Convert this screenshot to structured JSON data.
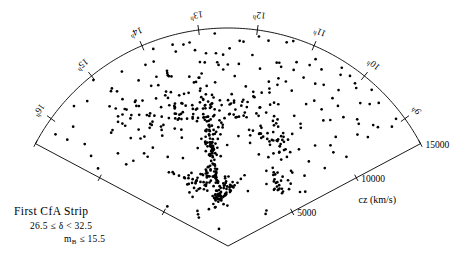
{
  "figure": {
    "title": "First CfA Strip",
    "dec_range": "26.5  ≤  δ <  32.5",
    "mag_limit_prefix": "m",
    "mag_limit_sub": "B",
    "mag_limit_suffix": "≤      15.5",
    "radial_axis_label": "cz  (km/s)"
  },
  "chart_data": {
    "type": "scatter",
    "subtype": "polar-wedge-redshift-survey",
    "title": "First CfA Strip",
    "subtitle": "26.5 ≤ δ < 32.5 ; m_B ≤ 15.5",
    "xlabel": "Right Ascension (hours)",
    "ylabel": "cz (km/s)",
    "radial_label": "cz  (km/s)",
    "radial_ticks": [
      5000,
      10000,
      15000
    ],
    "radial_tick_labels": [
      "5000",
      "10000",
      "15000"
    ],
    "rlim": [
      0,
      15000
    ],
    "angular_label": "Right Ascension",
    "angular_ticks": [
      16,
      15,
      14,
      13,
      12,
      11,
      10,
      9
    ],
    "angular_tick_labels": [
      "16ʰ",
      "15ʰ",
      "14ʰ",
      "13ʰ",
      "12ʰ",
      "11ʰ",
      "10ʰ",
      "9ʰ"
    ],
    "angular_unit": "hours of right ascension",
    "alim": [
      8.5,
      16.5
    ],
    "grid": false,
    "legend": null,
    "n_points": 568,
    "points_ra_cz": [
      [
        16.02,
        12100
      ],
      [
        15.88,
        13450
      ],
      [
        15.72,
        9900
      ],
      [
        15.58,
        14320
      ],
      [
        15.46,
        11200
      ],
      [
        15.35,
        13900
      ],
      [
        15.22,
        8600
      ],
      [
        15.1,
        12600
      ],
      [
        15.02,
        14700
      ],
      [
        14.92,
        10100
      ],
      [
        14.8,
        13100
      ],
      [
        14.7,
        7400
      ],
      [
        14.62,
        11800
      ],
      [
        14.52,
        14050
      ],
      [
        14.42,
        9200
      ],
      [
        14.33,
        12950
      ],
      [
        14.25,
        6800
      ],
      [
        14.16,
        10600
      ],
      [
        14.08,
        13700
      ],
      [
        13.99,
        8100
      ],
      [
        13.91,
        11450
      ],
      [
        13.84,
        14500
      ],
      [
        13.76,
        9650
      ],
      [
        13.69,
        12300
      ],
      [
        13.61,
        7050
      ],
      [
        13.54,
        10900
      ],
      [
        13.47,
        13850
      ],
      [
        13.4,
        8850
      ],
      [
        13.33,
        11950
      ],
      [
        13.26,
        6400
      ],
      [
        13.19,
        14250
      ],
      [
        13.12,
        10250
      ],
      [
        13.06,
        12800
      ],
      [
        12.99,
        7750
      ],
      [
        12.92,
        13350
      ],
      [
        12.86,
        9450
      ],
      [
        12.79,
        11300
      ],
      [
        12.73,
        14650
      ],
      [
        12.66,
        8350
      ],
      [
        12.6,
        12150
      ],
      [
        12.53,
        6950
      ],
      [
        12.47,
        13600
      ],
      [
        12.41,
        10450
      ],
      [
        12.34,
        9050
      ],
      [
        12.28,
        12550
      ],
      [
        12.22,
        14100
      ],
      [
        12.15,
        7600
      ],
      [
        12.09,
        11050
      ],
      [
        12.03,
        13250
      ],
      [
        11.97,
        8950
      ],
      [
        11.9,
        10750
      ],
      [
        11.84,
        12400
      ],
      [
        11.78,
        14400
      ],
      [
        11.72,
        7250
      ],
      [
        11.66,
        9800
      ],
      [
        11.6,
        11650
      ],
      [
        11.54,
        13050
      ],
      [
        11.48,
        8450
      ],
      [
        11.42,
        12050
      ],
      [
        11.36,
        14800
      ],
      [
        11.3,
        6650
      ],
      [
        11.24,
        10350
      ],
      [
        11.18,
        13500
      ],
      [
        11.12,
        9350
      ],
      [
        11.06,
        11550
      ],
      [
        11.0,
        7900
      ],
      [
        10.94,
        12700
      ],
      [
        10.88,
        14200
      ],
      [
        10.82,
        8650
      ],
      [
        10.76,
        10050
      ],
      [
        10.7,
        13750
      ],
      [
        10.64,
        11150
      ],
      [
        10.58,
        6200
      ],
      [
        10.52,
        12900
      ],
      [
        10.46,
        9550
      ],
      [
        10.4,
        14550
      ],
      [
        10.34,
        7350
      ],
      [
        10.28,
        11400
      ],
      [
        10.22,
        13150
      ],
      [
        10.16,
        8250
      ],
      [
        10.1,
        10850
      ],
      [
        10.04,
        12250
      ],
      [
        9.98,
        14000
      ],
      [
        9.92,
        6750
      ],
      [
        9.86,
        9150
      ],
      [
        9.8,
        11900
      ],
      [
        9.74,
        13400
      ],
      [
        9.68,
        8050
      ],
      [
        9.62,
        10550
      ],
      [
        9.56,
        12450
      ],
      [
        9.5,
        14300
      ],
      [
        9.44,
        7150
      ],
      [
        9.38,
        9700
      ],
      [
        9.32,
        11750
      ],
      [
        9.26,
        13000
      ],
      [
        9.2,
        8550
      ],
      [
        9.14,
        12200
      ],
      [
        9.08,
        10200
      ],
      [
        9.02,
        13950
      ],
      [
        8.96,
        6500
      ],
      [
        13.1,
        7200
      ],
      [
        13.1,
        6600
      ],
      [
        13.08,
        6000
      ],
      [
        13.12,
        7800
      ],
      [
        13.09,
        8400
      ],
      [
        13.11,
        5400
      ],
      [
        13.07,
        9000
      ],
      [
        13.13,
        4900
      ],
      [
        13.1,
        9600
      ],
      [
        13.08,
        4400
      ],
      [
        13.12,
        10200
      ],
      [
        13.09,
        3900
      ],
      [
        13.11,
        7500
      ],
      [
        13.07,
        6900
      ],
      [
        13.13,
        6300
      ],
      [
        13.1,
        5700
      ],
      [
        13.08,
        5100
      ],
      [
        13.12,
        8700
      ],
      [
        13.09,
        8100
      ],
      [
        13.11,
        4600
      ],
      [
        12.95,
        7100
      ],
      [
        12.9,
        6800
      ],
      [
        12.85,
        7400
      ],
      [
        13.25,
        7000
      ],
      [
        13.3,
        7300
      ],
      [
        13.35,
        6700
      ],
      [
        13.2,
        6400
      ],
      [
        12.8,
        6200
      ],
      [
        13.4,
        7600
      ],
      [
        12.75,
        7700
      ],
      [
        14.3,
        5200
      ],
      [
        14.15,
        5000
      ],
      [
        14.0,
        4800
      ],
      [
        13.85,
        4700
      ],
      [
        13.7,
        4600
      ],
      [
        13.55,
        4550
      ],
      [
        13.45,
        4650
      ],
      [
        14.45,
        5400
      ],
      [
        14.6,
        5600
      ],
      [
        14.75,
        5900
      ],
      [
        14.88,
        6200
      ],
      [
        15.0,
        6500
      ],
      [
        12.6,
        8800
      ],
      [
        12.45,
        9100
      ],
      [
        12.3,
        9400
      ],
      [
        12.15,
        9700
      ],
      [
        12.0,
        10000
      ],
      [
        11.85,
        10400
      ],
      [
        11.7,
        10800
      ],
      [
        11.55,
        11200
      ],
      [
        11.4,
        11600
      ],
      [
        11.25,
        12000
      ],
      [
        12.7,
        8500
      ],
      [
        12.8,
        8200
      ],
      [
        12.88,
        7900
      ],
      [
        14.55,
        10600
      ],
      [
        14.4,
        10300
      ],
      [
        14.25,
        10000
      ],
      [
        14.1,
        9700
      ],
      [
        13.95,
        9500
      ],
      [
        13.8,
        9300
      ],
      [
        13.65,
        9200
      ],
      [
        13.5,
        9100
      ],
      [
        13.35,
        9050
      ],
      [
        13.2,
        9000
      ],
      [
        14.7,
        10900
      ],
      [
        14.85,
        11200
      ],
      [
        15.0,
        11600
      ],
      [
        10.6,
        8400
      ],
      [
        10.75,
        8200
      ],
      [
        10.9,
        8000
      ],
      [
        11.05,
        7900
      ],
      [
        11.2,
        7850
      ],
      [
        11.35,
        7900
      ],
      [
        11.5,
        8000
      ],
      [
        9.8,
        5200
      ],
      [
        9.95,
        5300
      ],
      [
        10.1,
        5450
      ],
      [
        10.25,
        5600
      ],
      [
        10.4,
        5800
      ],
      [
        12.1,
        4200
      ],
      [
        12.25,
        4100
      ],
      [
        12.4,
        4050
      ],
      [
        12.55,
        4100
      ],
      [
        12.7,
        4200
      ],
      [
        11.95,
        4400
      ],
      [
        11.8,
        4700
      ],
      [
        11.65,
        5000
      ],
      [
        13.6,
        3600
      ],
      [
        13.45,
        3400
      ],
      [
        13.3,
        3300
      ],
      [
        13.15,
        3250
      ],
      [
        13.0,
        3300
      ],
      [
        12.85,
        3400
      ],
      [
        12.7,
        3600
      ],
      [
        15.3,
        3000
      ],
      [
        15.15,
        3200
      ],
      [
        15.45,
        2800
      ],
      [
        9.3,
        3400
      ],
      [
        9.45,
        3600
      ],
      [
        10.05,
        14200
      ],
      [
        10.2,
        14400
      ],
      [
        10.35,
        14100
      ],
      [
        9.6,
        13800
      ],
      [
        9.75,
        14600
      ]
    ]
  },
  "angular_axis": {
    "ticks": [
      {
        "label": "16",
        "sup": "h",
        "hour": 16.0
      },
      {
        "label": "15",
        "sup": "h",
        "hour": 15.0
      },
      {
        "label": "14",
        "sup": "h",
        "hour": 14.0
      },
      {
        "label": "13",
        "sup": "h",
        "hour": 13.0
      },
      {
        "label": "12",
        "sup": "h",
        "hour": 12.0
      },
      {
        "label": "11",
        "sup": "h",
        "hour": 11.0
      },
      {
        "label": "10",
        "sup": "h",
        "hour": 10.0
      },
      {
        "label": "9",
        "sup": "h",
        "hour": 9.0
      }
    ]
  },
  "radial_axis": {
    "ticks": [
      {
        "label": "5000",
        "value": 5000
      },
      {
        "label": "10000",
        "value": 10000
      },
      {
        "label": "15000",
        "value": 15000
      }
    ]
  }
}
